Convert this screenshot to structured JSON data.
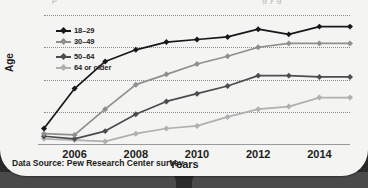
{
  "card": {
    "title_sliver_left": "p",
    "title_sliver_right": "g y g",
    "source_note": "Data Source: Pew Research Center survey"
  },
  "colors": {
    "series_18_29": "#17181a",
    "series_30_49": "#8f8f8f",
    "series_50_64": "#4c4c4e",
    "series_64_plus": "#b0b0b0",
    "gridline": "#8d8d8d",
    "axis": "#9a9a9a",
    "card_bg": "#f4f4f2",
    "page_band": "#4a4a4a",
    "text": "#1d1d1d"
  },
  "legend": {
    "position": "top-left-inside-plot",
    "items": [
      {
        "label": "18–29",
        "color": "#17181a"
      },
      {
        "label": "30–49",
        "color": "#8f8f8f"
      },
      {
        "label": "50–64",
        "color": "#4c4c4e"
      },
      {
        "label": "64 or older",
        "color": "#b0b0b0"
      }
    ]
  },
  "chart_data": {
    "type": "line",
    "title": "",
    "subtitle": "",
    "xlabel": "Years",
    "ylabel": "Age",
    "xlim": [
      2005,
      2015
    ],
    "ylim": [
      0,
      100
    ],
    "grid": true,
    "legend_position": "top-left",
    "x": [
      2005,
      2006,
      2007,
      2008,
      2009,
      2010,
      2011,
      2012,
      2013,
      2014,
      2015
    ],
    "xticks": [
      2006,
      2008,
      2010,
      2012,
      2014
    ],
    "xtick_labels": [
      "2006",
      "2008",
      "2010",
      "2012",
      "2014"
    ],
    "yticks": [
      0,
      25,
      50,
      75,
      100
    ],
    "ytick_labels": [
      "0",
      "25",
      "50",
      "75",
      "100"
    ],
    "series": [
      {
        "name": "18–29",
        "color": "#17181a",
        "values": [
          12,
          43,
          64,
          73,
          79,
          81,
          83,
          89,
          85,
          91,
          91
        ]
      },
      {
        "name": "30–49",
        "color": "#8f8f8f",
        "values": [
          8,
          7,
          27,
          46,
          54,
          62,
          68,
          75,
          78,
          78,
          78
        ]
      },
      {
        "name": "50–64",
        "color": "#4c4c4e",
        "values": [
          6,
          4,
          10,
          23,
          33,
          39,
          45,
          53,
          53,
          52,
          52
        ]
      },
      {
        "name": "64 or older",
        "color": "#b0b0b0",
        "values": [
          4,
          3,
          2,
          8,
          12,
          14,
          21,
          27,
          29,
          36,
          36
        ]
      }
    ],
    "source": "Data Source: Pew Research Center survey"
  }
}
